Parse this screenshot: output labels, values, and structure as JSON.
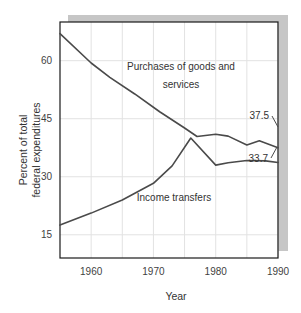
{
  "chart_data": {
    "type": "line",
    "title": "",
    "xlabel": "Year",
    "ylabel_line1": "Percent of total",
    "ylabel_line2": "federal expenditures",
    "xlim": [
      1955,
      1990
    ],
    "ylim": [
      9,
      70
    ],
    "xticks": [
      1960,
      1970,
      1980,
      1990
    ],
    "xtick_labels": [
      "1960",
      "1970",
      "1980",
      "1990"
    ],
    "yticks": [
      15,
      30,
      45,
      60
    ],
    "ytick_labels": [
      "15",
      "30",
      "45",
      "60"
    ],
    "grid": true,
    "grid_x_values": [
      1960,
      1965,
      1970,
      1975,
      1980,
      1985,
      1990
    ],
    "grid_y_values": [
      15,
      30,
      45,
      60
    ],
    "legend": "inline-annotations",
    "line_color": "#4a4a4a",
    "grid_color": "#e2e2e2",
    "frame_color": "#1a1a1a",
    "shadow_color": "#c6c6c6",
    "series": [
      {
        "name": "Purchases of goods and services",
        "label_line1": "Purchases of goods and",
        "label_line2": "services",
        "end_value_label": "37.5",
        "x": [
          1955,
          1960,
          1963,
          1967,
          1971,
          1975,
          1977,
          1980,
          1982,
          1985,
          1987,
          1990
        ],
        "values": [
          67.0,
          59.4,
          55.7,
          51.4,
          46.8,
          42.6,
          40.4,
          41.0,
          40.5,
          38.2,
          39.3,
          37.5
        ]
      },
      {
        "name": "Income transfers",
        "label": "Income transfers",
        "end_value_label": "33.7",
        "x": [
          1955,
          1960,
          1965,
          1970,
          1973,
          1976,
          1980,
          1982,
          1985,
          1988,
          1990
        ],
        "values": [
          17.5,
          20.6,
          24.0,
          28.3,
          32.8,
          40.0,
          33.0,
          33.6,
          34.2,
          34.1,
          33.7
        ]
      }
    ]
  }
}
